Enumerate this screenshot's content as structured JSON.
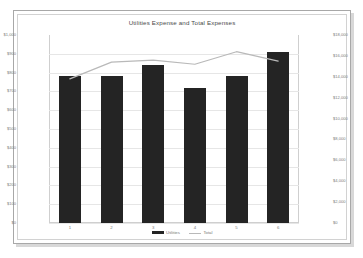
{
  "chart_data": {
    "type": "bar",
    "title": "Utilities Expense and Total Expenses",
    "xlabel": "",
    "ylabel": "",
    "categories": [
      "1",
      "2",
      "3",
      "4",
      "5",
      "6"
    ],
    "series": [
      {
        "name": "Utilities",
        "type": "bar",
        "axis": "left",
        "color": "#242424",
        "values": [
          780,
          780,
          840,
          720,
          780,
          910
        ]
      },
      {
        "name": "Total",
        "type": "line",
        "axis": "right",
        "color": "#b9b9b9",
        "values": [
          13800,
          15400,
          15600,
          15200,
          16400,
          15500
        ]
      }
    ],
    "left_axis": {
      "min": 0,
      "max": 1000,
      "ticks": [
        "$1,000",
        "$900",
        "$800",
        "$700",
        "$600",
        "$500",
        "$400",
        "$300",
        "$200",
        "$100",
        "$0"
      ],
      "tick_values": [
        1000,
        900,
        800,
        700,
        600,
        500,
        400,
        300,
        200,
        100,
        0
      ]
    },
    "right_axis": {
      "min": 0,
      "max": 18000,
      "ticks": [
        "$18,000",
        "$16,000",
        "$14,000",
        "$12,000",
        "$10,000",
        "$8,000",
        "$6,000",
        "$4,000",
        "$2,000",
        "$0"
      ],
      "tick_values": [
        18000,
        16000,
        14000,
        12000,
        10000,
        8000,
        6000,
        4000,
        2000,
        0
      ]
    },
    "legend": [
      {
        "label": "Utilities",
        "marker": "bar",
        "color": "#242424"
      },
      {
        "label": "Total",
        "marker": "line",
        "color": "#b9b9b9"
      }
    ],
    "legend_position": "bottom",
    "grid": true
  },
  "colors": {
    "bar": "#242424",
    "line": "#b9b9b9",
    "grid": "#e6e6e6",
    "axis_text": "#7d7d7d",
    "title_text": "#4a4a4a",
    "frame": "#a8a8a8",
    "background": "#ffffff"
  }
}
